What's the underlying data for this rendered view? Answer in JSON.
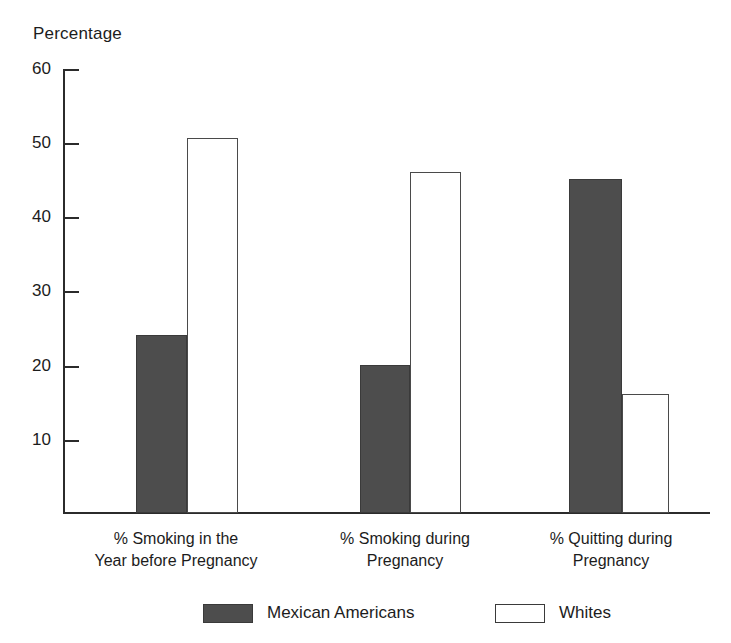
{
  "chart_data": {
    "type": "bar",
    "title": "",
    "ylabel": "Percentage",
    "xlabel": "",
    "ylim": [
      0,
      60
    ],
    "yticks": [
      10,
      20,
      30,
      40,
      50,
      60
    ],
    "grid": false,
    "legend_position": "bottom",
    "categories": [
      "% Smoking in the Year before Pregnancy",
      "% Smoking during Pregnancy",
      "% Quitting during Pregnancy"
    ],
    "category_lines": [
      {
        "line1": "% Smoking in the",
        "line2": "Year before Pregnancy"
      },
      {
        "line1": "% Smoking during",
        "line2": "Pregnancy"
      },
      {
        "line1": "% Quitting during",
        "line2": "Pregnancy"
      }
    ],
    "series": [
      {
        "name": "Mexican Americans",
        "color": "#4d4d4d",
        "values": [
          24,
          20,
          45
        ]
      },
      {
        "name": "Whites",
        "color": "#ffffff",
        "values": [
          50.5,
          46,
          16
        ]
      }
    ]
  },
  "axis": {
    "title": "Percentage",
    "tick_10": "10",
    "tick_20": "20",
    "tick_30": "30",
    "tick_40": "40",
    "tick_50": "50",
    "tick_60": "60"
  },
  "categories": {
    "c0_line1": "% Smoking in the",
    "c0_line2": "Year before Pregnancy",
    "c1_line1": "% Smoking during",
    "c1_line2": "Pregnancy",
    "c2_line1": "% Quitting during",
    "c2_line2": "Pregnancy"
  },
  "legend": {
    "item0_label": "Mexican Americans",
    "item1_label": "Whites"
  }
}
